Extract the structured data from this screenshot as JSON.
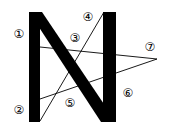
{
  "figure": {
    "letter": "N",
    "colors": {
      "stroke": "#000000",
      "background": "#ffffff"
    },
    "labels": [
      {
        "id": "1",
        "text": "①"
      },
      {
        "id": "2",
        "text": "②"
      },
      {
        "id": "3",
        "text": "③"
      },
      {
        "id": "4",
        "text": "④"
      },
      {
        "id": "5",
        "text": "⑤"
      },
      {
        "id": "6",
        "text": "⑥"
      },
      {
        "id": "7",
        "text": "⑦"
      }
    ]
  }
}
